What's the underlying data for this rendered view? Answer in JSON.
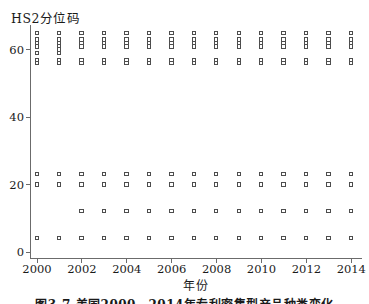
{
  "colors": {
    "background": "#ffffff",
    "text": "#1a1a1a",
    "axis": "#6b6b6b",
    "marker_border": "#4d4d4d",
    "marker_fill": "#ffffff"
  },
  "caption_partial": "图3-7 美国2000—2014年专利密集型产品种类变化",
  "chart_data": {
    "type": "scatter",
    "title": "",
    "ylabel": "HS2分位码",
    "xlabel": "年份",
    "marker": "open-square",
    "grid": false,
    "legend": "none",
    "x_ticks": [
      2000,
      2002,
      2004,
      2006,
      2008,
      2010,
      2012,
      2014
    ],
    "y_ticks": [
      0,
      20,
      40,
      60
    ],
    "xlim": [
      1999.7,
      2014.9
    ],
    "ylim": [
      0,
      67
    ],
    "points": [
      {
        "year": 2000,
        "codes": [
          65,
          63,
          62,
          61,
          59,
          57,
          56,
          23,
          20,
          4
        ]
      },
      {
        "year": 2001,
        "codes": [
          65,
          63,
          62,
          61,
          60,
          59,
          57,
          56,
          23,
          20,
          4
        ]
      },
      {
        "year": 2002,
        "codes": [
          65,
          63,
          62,
          61,
          57,
          56,
          23,
          20,
          12,
          4
        ]
      },
      {
        "year": 2003,
        "codes": [
          65,
          63,
          62,
          61,
          57,
          56,
          23,
          20,
          12,
          4
        ]
      },
      {
        "year": 2004,
        "codes": [
          65,
          63,
          62,
          61,
          57,
          56,
          23,
          20,
          12,
          4
        ]
      },
      {
        "year": 2005,
        "codes": [
          65,
          63,
          62,
          61,
          57,
          56,
          23,
          20,
          12,
          4
        ]
      },
      {
        "year": 2006,
        "codes": [
          65,
          63,
          62,
          61,
          57,
          56,
          23,
          20,
          12,
          4
        ]
      },
      {
        "year": 2007,
        "codes": [
          65,
          63,
          62,
          61,
          57,
          56,
          23,
          20,
          12,
          4
        ]
      },
      {
        "year": 2008,
        "codes": [
          65,
          63,
          62,
          61,
          57,
          56,
          23,
          20,
          12,
          4
        ]
      },
      {
        "year": 2009,
        "codes": [
          65,
          63,
          62,
          61,
          57,
          56,
          23,
          20,
          12,
          4
        ]
      },
      {
        "year": 2010,
        "codes": [
          65,
          63,
          62,
          61,
          57,
          56,
          23,
          20,
          12,
          4
        ]
      },
      {
        "year": 2011,
        "codes": [
          65,
          63,
          62,
          61,
          57,
          56,
          23,
          20,
          12,
          4
        ]
      },
      {
        "year": 2012,
        "codes": [
          65,
          63,
          62,
          61,
          57,
          56,
          23,
          20,
          12,
          4
        ]
      },
      {
        "year": 2013,
        "codes": [
          65,
          63,
          62,
          61,
          57,
          56,
          23,
          20,
          12,
          4
        ]
      },
      {
        "year": 2014,
        "codes": [
          65,
          63,
          62,
          61,
          57,
          56,
          23,
          20,
          12,
          4
        ]
      }
    ]
  }
}
